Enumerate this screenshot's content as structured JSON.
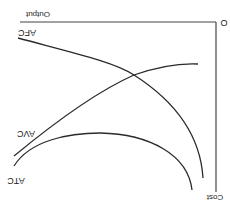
{
  "diagram": {
    "orientation": "rotated-180",
    "labels": {
      "origin": "O",
      "x_axis": "Output",
      "y_axis": "Cost",
      "afc": "AFC",
      "avc": "AVC",
      "atc": "ATC"
    },
    "colors": {
      "background": "#ffffff",
      "line": "#2a2a2a",
      "axis": "#444444"
    },
    "curves": [
      {
        "name": "AFC",
        "description": "Average Fixed Cost, continuously declining"
      },
      {
        "name": "AVC",
        "description": "Average Variable Cost, rising"
      },
      {
        "name": "ATC",
        "description": "Average Total Cost, U-shaped"
      }
    ]
  }
}
